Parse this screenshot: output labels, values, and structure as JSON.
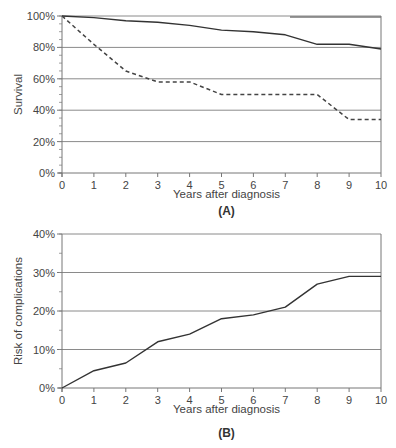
{
  "chart_data": [
    {
      "type": "line",
      "panel_label": "(A)",
      "title": "",
      "xlabel": "Years after diagnosis",
      "ylabel": "Survival",
      "x": [
        0,
        1,
        2,
        3,
        4,
        5,
        6,
        7,
        8,
        9,
        10
      ],
      "xticks": [
        "0",
        "1",
        "2",
        "3",
        "4",
        "5",
        "6",
        "7",
        "8",
        "9",
        "10"
      ],
      "yticks": [
        "0%",
        "20%",
        "40%",
        "60%",
        "80%",
        "100%"
      ],
      "ytick_values": [
        0,
        20,
        40,
        60,
        80,
        100
      ],
      "xlim": [
        0,
        10
      ],
      "ylim": [
        0,
        100
      ],
      "grid": "horizontal",
      "legend": "none",
      "series": [
        {
          "name": "solid",
          "style": "solid",
          "color": "#333333",
          "values": [
            100,
            99,
            97,
            96,
            94,
            91,
            90,
            88,
            82,
            82,
            79
          ]
        },
        {
          "name": "dashed",
          "style": "dashed",
          "color": "#444444",
          "values": [
            100,
            82,
            65,
            58,
            58,
            50,
            50,
            50,
            50,
            34,
            34
          ]
        }
      ]
    },
    {
      "type": "line",
      "panel_label": "(B)",
      "title": "",
      "xlabel": "Years after diagnosis",
      "ylabel": "Risk of complications",
      "x": [
        0,
        1,
        2,
        3,
        4,
        5,
        6,
        7,
        8,
        9,
        10
      ],
      "xticks": [
        "0",
        "1",
        "2",
        "3",
        "4",
        "5",
        "6",
        "7",
        "8",
        "9",
        "10"
      ],
      "yticks": [
        "0%",
        "10%",
        "20%",
        "30%",
        "40%"
      ],
      "ytick_values": [
        0,
        10,
        20,
        30,
        40
      ],
      "xlim": [
        0,
        10
      ],
      "ylim": [
        0,
        40
      ],
      "grid": "horizontal",
      "legend": "none",
      "series": [
        {
          "name": "risk",
          "style": "solid",
          "color": "#333333",
          "values": [
            0,
            4.5,
            6.5,
            12,
            14,
            18,
            19,
            21,
            27,
            29,
            29
          ]
        }
      ]
    }
  ]
}
